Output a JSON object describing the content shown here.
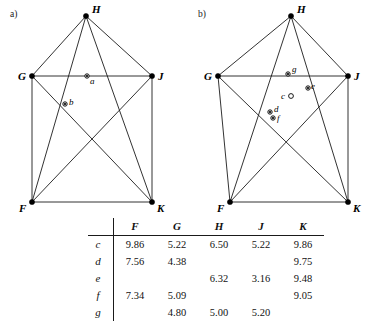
{
  "figure": {
    "panels": [
      {
        "id": "a",
        "label": "a)",
        "vertices": [
          {
            "name": "H",
            "label": "H",
            "x": 86,
            "y": 16
          },
          {
            "name": "G",
            "label": "G",
            "x": 32,
            "y": 76
          },
          {
            "name": "J",
            "label": "J",
            "x": 152,
            "y": 76
          },
          {
            "name": "F",
            "label": "F",
            "x": 32,
            "y": 202
          },
          {
            "name": "K",
            "label": "K",
            "x": 152,
            "y": 202
          }
        ],
        "points": [
          {
            "name": "a",
            "label": "a",
            "x": 87,
            "y": 76,
            "style": "filled-ring"
          },
          {
            "name": "b",
            "label": "b",
            "x": 65,
            "y": 104,
            "style": "filled-ring"
          }
        ]
      },
      {
        "id": "b",
        "label": "b)",
        "vertices": [
          {
            "name": "H",
            "label": "H",
            "x": 291,
            "y": 16
          },
          {
            "name": "G",
            "label": "G",
            "x": 218,
            "y": 76
          },
          {
            "name": "J",
            "label": "J",
            "x": 348,
            "y": 76
          },
          {
            "name": "F",
            "label": "F",
            "x": 230,
            "y": 202
          },
          {
            "name": "K",
            "label": "K",
            "x": 348,
            "y": 202
          }
        ],
        "points": [
          {
            "name": "c",
            "label": "c",
            "x": 291,
            "y": 96,
            "style": "ring"
          },
          {
            "name": "d",
            "label": "d",
            "x": 270,
            "y": 112,
            "style": "filled-ring"
          },
          {
            "name": "e",
            "label": "e",
            "x": 308,
            "y": 88,
            "style": "filled-ring"
          },
          {
            "name": "f",
            "label": "f",
            "x": 273,
            "y": 118,
            "style": "filled-ring"
          },
          {
            "name": "g",
            "label": "g",
            "x": 288,
            "y": 74,
            "style": "filled-ring"
          }
        ]
      }
    ]
  },
  "table": {
    "corner_label": "",
    "columns": [
      "F",
      "G",
      "H",
      "J",
      "K"
    ],
    "rows": [
      {
        "label": "c",
        "values": [
          "9.86",
          "5.22",
          "6.50",
          "5.22",
          "9.86"
        ]
      },
      {
        "label": "d",
        "values": [
          "7.56",
          "4.38",
          "",
          "",
          "9.75"
        ]
      },
      {
        "label": "e",
        "values": [
          "",
          "",
          "6.32",
          "3.16",
          "9.48"
        ]
      },
      {
        "label": "f",
        "values": [
          "7.34",
          "5.09",
          "",
          "",
          "9.05"
        ]
      },
      {
        "label": "g",
        "values": [
          "",
          "4.80",
          "5.00",
          "5.20",
          ""
        ]
      }
    ]
  }
}
